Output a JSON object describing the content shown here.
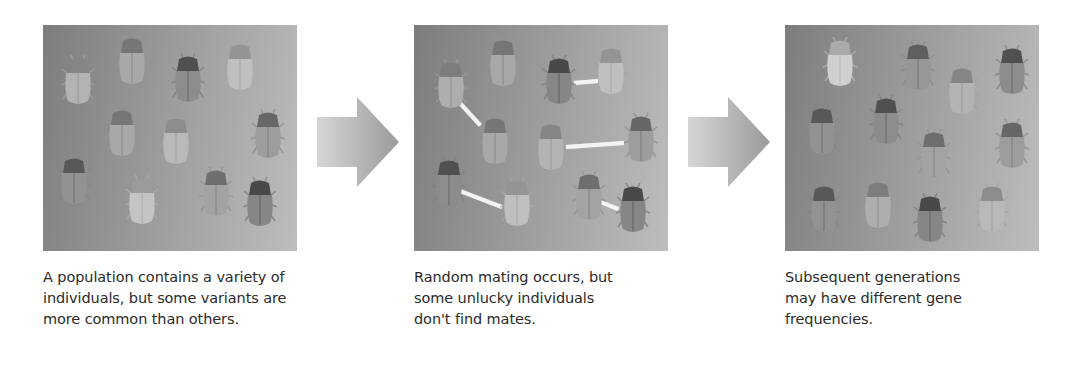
{
  "figure": {
    "panels": [
      {
        "id": "initial-population",
        "caption_lines": [
          "A population contains a variety of",
          "individuals, but some variants are",
          "more common than others."
        ],
        "beetles": [
          {
            "x": 18,
            "y": 30,
            "shade": 0.45
          },
          {
            "x": 72,
            "y": 10,
            "shade": 0.55
          },
          {
            "x": 128,
            "y": 28,
            "shade": 0.8
          },
          {
            "x": 180,
            "y": 16,
            "shade": 0.35
          },
          {
            "x": 62,
            "y": 82,
            "shade": 0.55
          },
          {
            "x": 116,
            "y": 90,
            "shade": 0.4
          },
          {
            "x": 208,
            "y": 84,
            "shade": 0.65
          },
          {
            "x": 14,
            "y": 130,
            "shade": 0.75
          },
          {
            "x": 82,
            "y": 150,
            "shade": 0.3
          },
          {
            "x": 156,
            "y": 142,
            "shade": 0.6
          },
          {
            "x": 200,
            "y": 152,
            "shade": 0.85
          }
        ],
        "mate_lines": []
      },
      {
        "id": "random-mating",
        "caption_lines": [
          "Random mating occurs, but",
          "some unlucky individuals",
          "don't find mates."
        ],
        "beetles": [
          {
            "x": 20,
            "y": 34,
            "shade": 0.5
          },
          {
            "x": 72,
            "y": 12,
            "shade": 0.55
          },
          {
            "x": 128,
            "y": 30,
            "shade": 0.85
          },
          {
            "x": 180,
            "y": 20,
            "shade": 0.35
          },
          {
            "x": 64,
            "y": 90,
            "shade": 0.55
          },
          {
            "x": 120,
            "y": 96,
            "shade": 0.45
          },
          {
            "x": 210,
            "y": 88,
            "shade": 0.65
          },
          {
            "x": 18,
            "y": 132,
            "shade": 0.8
          },
          {
            "x": 86,
            "y": 152,
            "shade": 0.35
          },
          {
            "x": 158,
            "y": 146,
            "shade": 0.6
          },
          {
            "x": 202,
            "y": 158,
            "shade": 0.85
          }
        ],
        "mate_lines": [
          {
            "x1": 44,
            "y1": 74,
            "x2": 66,
            "y2": 98
          },
          {
            "x1": 160,
            "y1": 56,
            "x2": 184,
            "y2": 54
          },
          {
            "x1": 152,
            "y1": 120,
            "x2": 210,
            "y2": 116
          },
          {
            "x1": 46,
            "y1": 164,
            "x2": 88,
            "y2": 180
          },
          {
            "x1": 184,
            "y1": 174,
            "x2": 204,
            "y2": 182
          }
        ]
      },
      {
        "id": "subsequent-generation",
        "caption_lines": [
          "Subsequent generations",
          "may have different gene",
          "frequencies."
        ],
        "beetles": [
          {
            "x": 38,
            "y": 12,
            "shade": 0.2
          },
          {
            "x": 116,
            "y": 16,
            "shade": 0.7
          },
          {
            "x": 160,
            "y": 40,
            "shade": 0.45
          },
          {
            "x": 210,
            "y": 20,
            "shade": 0.8
          },
          {
            "x": 20,
            "y": 80,
            "shade": 0.75
          },
          {
            "x": 84,
            "y": 70,
            "shade": 0.8
          },
          {
            "x": 132,
            "y": 104,
            "shade": 0.6
          },
          {
            "x": 210,
            "y": 94,
            "shade": 0.65
          },
          {
            "x": 22,
            "y": 158,
            "shade": 0.75
          },
          {
            "x": 76,
            "y": 154,
            "shade": 0.5
          },
          {
            "x": 128,
            "y": 168,
            "shade": 0.85
          },
          {
            "x": 190,
            "y": 158,
            "shade": 0.4
          }
        ],
        "mate_lines": []
      }
    ],
    "arrows": [
      {
        "direction": "right"
      },
      {
        "direction": "right"
      }
    ]
  }
}
